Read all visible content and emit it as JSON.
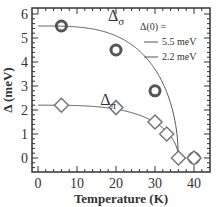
{
  "chart_data": {
    "type": "scatter",
    "title": "",
    "xlabel": "Temperature (K)",
    "ylabel": "Δ (meV)",
    "xlim": [
      -2,
      44
    ],
    "ylim": [
      -0.6,
      6.3
    ],
    "xticks": [
      "0",
      "10",
      "20",
      "30",
      "40"
    ],
    "yticks": [
      "0",
      "1",
      "2",
      "3",
      "4",
      "5",
      "6"
    ],
    "legend": {
      "title": "Δ(0) =",
      "entries": [
        "5.5 meV",
        "2.2 meV"
      ],
      "position": "upper right"
    },
    "annotations": [
      {
        "text": "Δ",
        "sub": "σ",
        "x": 20,
        "y": 5.7
      },
      {
        "text": "Δ",
        "sub": "π",
        "x": 18,
        "y": 2.2
      }
    ],
    "series": [
      {
        "name": "Δσ data",
        "marker": "circle",
        "x": [
          6,
          20,
          30,
          40
        ],
        "y": [
          5.5,
          4.5,
          2.8,
          0.0
        ]
      },
      {
        "name": "Δπ data",
        "marker": "diamond",
        "x": [
          6,
          20,
          30,
          33,
          36,
          40
        ],
        "y": [
          2.2,
          2.1,
          1.5,
          1.0,
          0.0,
          0.0
        ]
      },
      {
        "name": "5.5 meV BCS fit",
        "marker": "line",
        "delta0": 5.5,
        "tc": 36
      },
      {
        "name": "2.2 meV BCS fit",
        "marker": "line",
        "delta0": 2.2,
        "tc": 36
      }
    ]
  }
}
